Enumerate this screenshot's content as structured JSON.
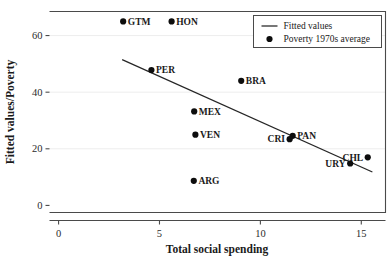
{
  "chart_data": {
    "type": "scatter",
    "title": "",
    "xlabel": "Total social spending",
    "ylabel": "Fitted values/Poverty",
    "xlim": [
      -0.45,
      16.2
    ],
    "ylim": [
      -2.5,
      68.5
    ],
    "xticks": [
      0,
      5,
      10,
      15
    ],
    "xticklabels": [
      "0",
      "5",
      "10",
      "15"
    ],
    "yticks": [
      0,
      20,
      40,
      60
    ],
    "yticklabels": [
      "0",
      "20",
      "40",
      "60"
    ],
    "grid": "horizontal",
    "legend_position": "top-right",
    "legend": [
      {
        "marker": "line",
        "label": "Fitted values"
      },
      {
        "marker": "dot",
        "label": "Poverty 1970s average"
      }
    ],
    "points": [
      {
        "label": "GTM",
        "x": 3.2,
        "y": 65.0,
        "label_side": "right"
      },
      {
        "label": "HON",
        "x": 5.6,
        "y": 65.0,
        "label_side": "right"
      },
      {
        "label": "PER",
        "x": 4.6,
        "y": 47.8,
        "label_side": "right"
      },
      {
        "label": "BRA",
        "x": 9.05,
        "y": 44.0,
        "label_side": "right"
      },
      {
        "label": "MEX",
        "x": 6.72,
        "y": 33.2,
        "label_side": "right"
      },
      {
        "label": "VEN",
        "x": 6.78,
        "y": 25.0,
        "label_side": "right"
      },
      {
        "label": "ARG",
        "x": 6.7,
        "y": 8.7,
        "label_side": "right"
      },
      {
        "label": "PAN",
        "x": 11.6,
        "y": 24.6,
        "label_side": "right"
      },
      {
        "label": "CRI",
        "x": 11.45,
        "y": 23.4,
        "label_side": "left"
      },
      {
        "label": "CHL",
        "x": 15.32,
        "y": 17.0,
        "label_side": "left"
      },
      {
        "label": "URY",
        "x": 14.45,
        "y": 14.8,
        "label_side": "left"
      }
    ],
    "fitted_line": {
      "x_start": 3.15,
      "y_start": 51.5,
      "x_end": 15.55,
      "y_end": 11.8
    }
  }
}
